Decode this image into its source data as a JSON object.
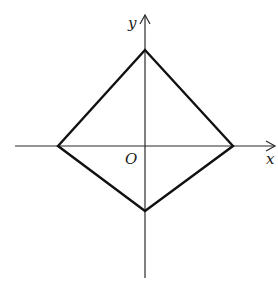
{
  "diagram": {
    "type": "coordinate-plane-quadrilateral",
    "axes": {
      "x_label": "x",
      "y_label": "y",
      "origin_label": "O"
    },
    "quadrilateral": {
      "vertices": [
        "top",
        "right",
        "bottom",
        "left"
      ],
      "description": "Kite/rhombus-like quadrilateral with vertices on the coordinate axes"
    },
    "colors": {
      "axis": "#2a2a2a",
      "shape": "#111111",
      "background": "#ffffff"
    }
  }
}
